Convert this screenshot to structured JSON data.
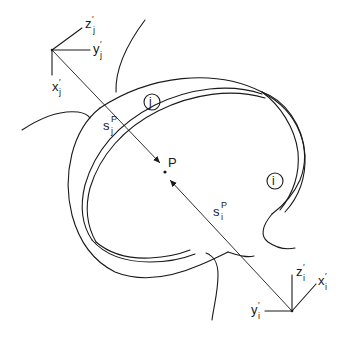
{
  "diagram": {
    "frame_j": {
      "x_label": "x",
      "x_sub": "j",
      "y_label": "y",
      "y_sub": "j",
      "z_label": "z",
      "z_sub": "j",
      "prime": "′"
    },
    "frame_i": {
      "x_label": "x",
      "x_sub": "i",
      "y_label": "y",
      "y_sub": "i",
      "z_label": "z",
      "z_sub": "i",
      "prime": "′"
    },
    "vector_j": {
      "label": "s",
      "sup": "P",
      "sub": "j"
    },
    "vector_i": {
      "label": "s",
      "sup": "P",
      "sub": "i"
    },
    "point": {
      "label": "P"
    },
    "body_j": {
      "label": "j"
    },
    "body_i": {
      "label": "i"
    }
  }
}
